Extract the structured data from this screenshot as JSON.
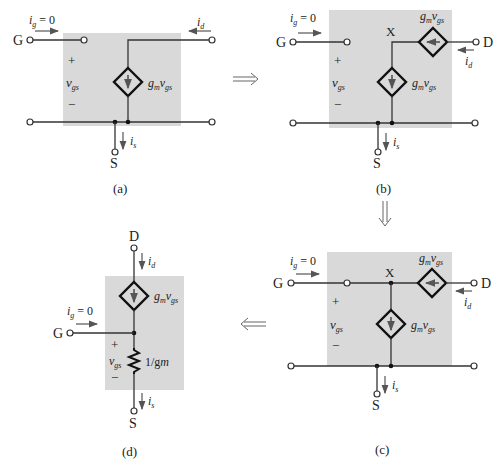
{
  "figure": {
    "panels": [
      {
        "id": "a",
        "caption": "(a)",
        "labels": {
          "gate": "G",
          "drain": "D",
          "source": "S",
          "ig": "i",
          "ig_sub": "g",
          "ig_eq": " = 0",
          "id": "i",
          "id_sub": "d",
          "is": "i",
          "is_sub": "s",
          "plus": "+",
          "minus": "−",
          "vgs": "v",
          "vgs_sub": "gs",
          "src": "g",
          "src_sub": "m",
          "src_v": "v",
          "src_vsub": "gs"
        }
      },
      {
        "id": "b",
        "caption": "(b)",
        "labels": {
          "gate": "G",
          "drain": "D",
          "source": "S",
          "node_x": "X",
          "ig": "i",
          "ig_sub": "g",
          "ig_eq": " = 0",
          "id": "i",
          "id_sub": "d",
          "is": "i",
          "is_sub": "s",
          "plus": "+",
          "minus": "−",
          "vgs": "v",
          "vgs_sub": "gs",
          "src": "g",
          "src_sub": "m",
          "src_v": "v",
          "src_vsub": "gs"
        }
      },
      {
        "id": "c",
        "caption": "(c)",
        "labels": {
          "gate": "G",
          "drain": "D",
          "source": "S",
          "node_x": "X",
          "ig": "i",
          "ig_sub": "g",
          "ig_eq": " = 0",
          "id": "i",
          "id_sub": "d",
          "is": "i",
          "is_sub": "s",
          "plus": "+",
          "minus": "−",
          "vgs": "v",
          "vgs_sub": "gs",
          "src": "g",
          "src_sub": "m",
          "src_v": "v",
          "src_vsub": "gs"
        }
      },
      {
        "id": "d",
        "caption": "(d)",
        "labels": {
          "gate": "G",
          "drain": "D",
          "source": "S",
          "ig": "i",
          "ig_sub": "g",
          "ig_eq": " = 0",
          "id": "i",
          "id_sub": "d",
          "is": "i",
          "is_sub": "s",
          "plus": "+",
          "minus": "−",
          "vgs": "v",
          "vgs_sub": "gs",
          "src": "g",
          "src_sub": "m",
          "src_v": "v",
          "src_vsub": "gs",
          "res": "1/g",
          "res_sub": "m"
        }
      }
    ],
    "transitions": [
      {
        "from": "a",
        "to": "b",
        "glyph": "⟹"
      },
      {
        "from": "b",
        "to": "c",
        "glyph": "⇓"
      },
      {
        "from": "c",
        "to": "d",
        "glyph": "⟸"
      }
    ]
  }
}
